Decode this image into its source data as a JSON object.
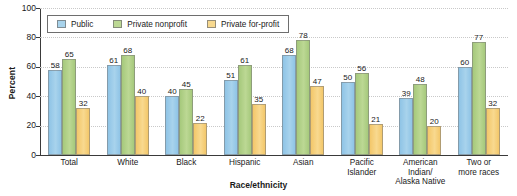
{
  "chart_data": {
    "type": "bar",
    "title": "",
    "xlabel": "Race/ethnicity",
    "ylabel": "Percent",
    "ylim": [
      0,
      100
    ],
    "yticks": [
      0,
      20,
      40,
      60,
      80,
      100
    ],
    "grid": true,
    "legend_position": "top-left",
    "categories": [
      "Total",
      "White",
      "Black",
      "Hispanic",
      "Asian",
      "Pacific Islander",
      "American Indian/ Alaska Native",
      "Two or more races"
    ],
    "category_lines": [
      [
        "Total"
      ],
      [
        "White"
      ],
      [
        "Black"
      ],
      [
        "Hispanic"
      ],
      [
        "Asian"
      ],
      [
        "Pacific",
        "Islander"
      ],
      [
        "American",
        "Indian/",
        "Alaska Native"
      ],
      [
        "Two or",
        "more races"
      ]
    ],
    "series": [
      {
        "name": "Public",
        "color": "#a8d3ec",
        "values": [
          58,
          61,
          40,
          51,
          68,
          50,
          39,
          60
        ]
      },
      {
        "name": "Private nonprofit",
        "color": "#bcd894",
        "values": [
          65,
          68,
          45,
          61,
          78,
          56,
          48,
          77
        ]
      },
      {
        "name": "Private for-profit",
        "color": "#f8d98f",
        "values": [
          32,
          40,
          22,
          35,
          47,
          21,
          20,
          32
        ]
      }
    ]
  },
  "axis": {
    "y_title": "Percent",
    "x_title": "Race/ethnicity",
    "y_tick_labels": [
      "100",
      "80",
      "60",
      "40",
      "20",
      "0"
    ]
  },
  "legend": {
    "items": [
      {
        "label": "Public",
        "swatch": "public-swatch-icon"
      },
      {
        "label": "Private nonprofit",
        "swatch": "nonprofit-swatch-icon"
      },
      {
        "label": "Private for-profit",
        "swatch": "forprofit-swatch-icon"
      }
    ]
  }
}
